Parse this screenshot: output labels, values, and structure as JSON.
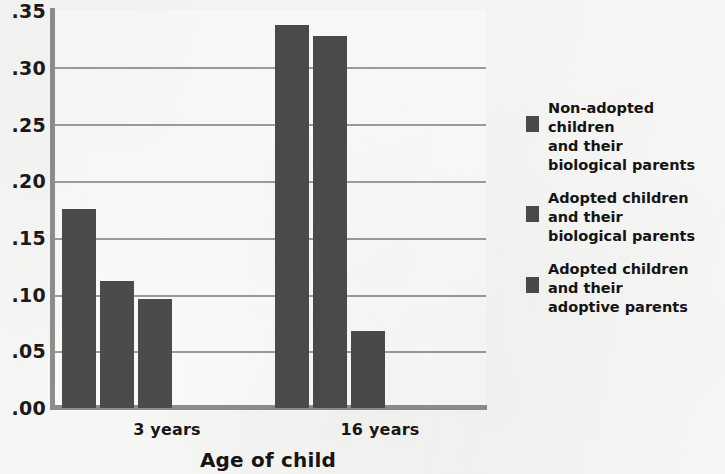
{
  "chart_data": {
    "type": "bar",
    "title": "",
    "xlabel": "Age of child",
    "ylabel": "",
    "categories": [
      "3 years",
      "16 years"
    ],
    "ylim": [
      0.0,
      0.35
    ],
    "ytick_labels": [
      ".35",
      ".30",
      ".25",
      ".20",
      ".15",
      ".10",
      ".05",
      ".00"
    ],
    "ytick_values": [
      0.35,
      0.3,
      0.25,
      0.2,
      0.15,
      0.1,
      0.05,
      0.0
    ],
    "grid": true,
    "legend_position": "right",
    "bar_color": "#4b4b4b",
    "series": [
      {
        "name": "Non-adopted children and their biological parents",
        "values": [
          0.175,
          0.337
        ]
      },
      {
        "name": "Adopted children and their biological parents",
        "values": [
          0.112,
          0.327
        ]
      },
      {
        "name": "Adopted children and their adoptive parents",
        "values": [
          0.096,
          0.068
        ]
      }
    ]
  },
  "axis": {
    "x_title": "Age of child",
    "x_tick_labels": [
      "3 years",
      "16 years"
    ],
    "y_tick_labels": [
      ".35",
      ".30",
      ".25",
      ".20",
      ".15",
      ".10",
      ".05",
      ".00"
    ]
  },
  "legend": {
    "items": [
      {
        "swatch_color": "#4b4b4b",
        "label": "Non-adopted children\nand their\nbiological parents"
      },
      {
        "swatch_color": "#4b4b4b",
        "label": "Adopted children\nand their\nbiological parents"
      },
      {
        "swatch_color": "#4b4b4b",
        "label": "Adopted children\nand  their\nadoptive parents"
      }
    ]
  }
}
